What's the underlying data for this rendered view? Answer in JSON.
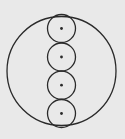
{
  "diagram": {
    "background": "#e9e9e9",
    "stroke": "#2a2a2a",
    "outer_circle": {
      "cx": 61.5,
      "cy": 71,
      "r": 54.5
    },
    "inner_circles": [
      {
        "cx": 61.5,
        "cy": 28.5,
        "r": 14
      },
      {
        "cx": 61.5,
        "cy": 57,
        "r": 14
      },
      {
        "cx": 61.5,
        "cy": 85.2,
        "r": 14
      },
      {
        "cx": 61.5,
        "cy": 113.5,
        "r": 14
      }
    ],
    "center_dot_radius": 1.4
  }
}
